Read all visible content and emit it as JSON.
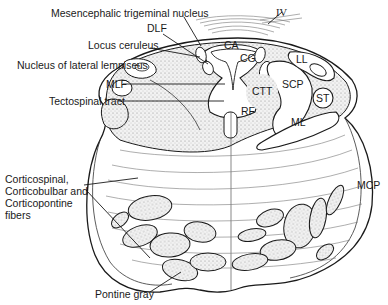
{
  "figure": {
    "labels_left": [
      {
        "id": "mesencephalic-trigeminal-nucleus",
        "text": "Mesencephalic trigeminal nucleus"
      },
      {
        "id": "dlf",
        "text": "DLF"
      },
      {
        "id": "locus-ceruleus",
        "text": "Locus ceruleus"
      },
      {
        "id": "nucleus-lateral-lemniscus",
        "text": "Nucleus of lateral lemniscus"
      },
      {
        "id": "mlf",
        "text": "MLF"
      },
      {
        "id": "tectospinal-tract",
        "text": "Tectospinal tract"
      },
      {
        "id": "corticospinal",
        "lines": [
          "Corticospinal,",
          "Corticobulbar and",
          "Corticopontine",
          "fibers"
        ]
      },
      {
        "id": "pontine-gray",
        "text": "Pontine gray"
      }
    ],
    "labels_inner": {
      "iv": "IV",
      "ca": "CA",
      "cg": "CG",
      "ll": "LL",
      "scp": "SCP",
      "ctt": "CTT",
      "st": "ST",
      "rf": "RF",
      "ml": "ML",
      "mcp": "MCP"
    }
  }
}
